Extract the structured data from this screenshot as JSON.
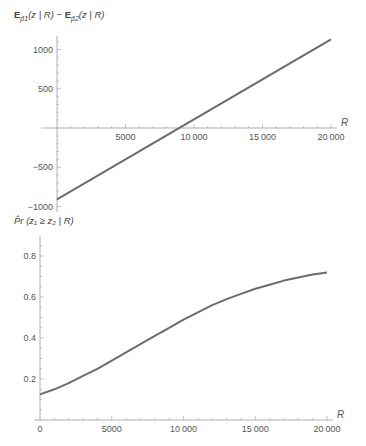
{
  "chart_data": [
    {
      "type": "line",
      "title": "",
      "ylabel": "E_{p̂1}(z | R) − E_{p̂2}(z | R)",
      "xlabel": "R",
      "xlim": [
        0,
        20000
      ],
      "ylim": [
        -1000,
        1150
      ],
      "x_ticks": [
        5000,
        10000,
        15000,
        20000
      ],
      "x_tick_labels": [
        "5000",
        "10000",
        "15000",
        "20000"
      ],
      "y_ticks": [
        -1000,
        -500,
        500,
        1000
      ],
      "y_tick_labels": [
        "-1000",
        "-500",
        "500",
        "1000"
      ],
      "grid": false,
      "legend": null,
      "series": [
        {
          "name": "difference",
          "x": [
            0,
            5000,
            10000,
            15000,
            20000
          ],
          "y": [
            -910,
            -400,
            110,
            620,
            1130
          ]
        }
      ]
    },
    {
      "type": "line",
      "title": "",
      "ylabel": "P̂r(z1 ≥ z2 | R)",
      "xlabel": "R",
      "xlim": [
        0,
        20000
      ],
      "ylim": [
        0,
        0.9
      ],
      "x_ticks": [
        0,
        5000,
        10000,
        15000,
        20000
      ],
      "x_tick_labels": [
        "0",
        "5000",
        "10000",
        "15000",
        "20000"
      ],
      "y_ticks": [
        0.2,
        0.4,
        0.6,
        0.8
      ],
      "y_tick_labels": [
        "0.2",
        "0.4",
        "0.6",
        "0.8"
      ],
      "grid": false,
      "legend": null,
      "series": [
        {
          "name": "probability",
          "x": [
            0,
            1000,
            2000,
            3000,
            4000,
            5000,
            6000,
            7000,
            8000,
            9000,
            10000,
            11000,
            12000,
            13000,
            14000,
            15000,
            16000,
            17000,
            18000,
            19000,
            20000
          ],
          "y": [
            0.125,
            0.15,
            0.18,
            0.215,
            0.25,
            0.29,
            0.33,
            0.37,
            0.41,
            0.45,
            0.49,
            0.525,
            0.56,
            0.59,
            0.615,
            0.64,
            0.66,
            0.68,
            0.695,
            0.71,
            0.72
          ]
        }
      ]
    }
  ],
  "labels": {
    "top_ylabel_main": "E",
    "top_ylabel_sub1": "p̂1",
    "top_ylabel_mid": "(z | R) − ",
    "top_ylabel_sub2": "p̂2",
    "top_ylabel_end": "(z | R)",
    "bottom_ylabel": "P̂r (z₁ ≥ z₂ | R)",
    "x_axis_name": "R"
  },
  "colors": {
    "line": "#6b6b6b",
    "axis": "#9a9a9a"
  }
}
